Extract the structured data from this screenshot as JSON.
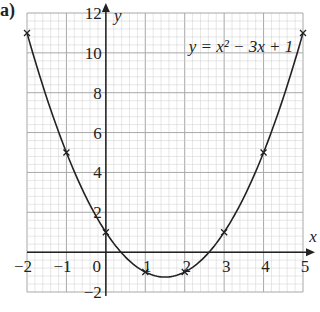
{
  "part_label": "a)",
  "chart_data": {
    "type": "line",
    "title": "",
    "equation_label": "y = x² − 3x + 1",
    "xlabel": "x",
    "ylabel": "y",
    "xlim": [
      -2,
      5
    ],
    "ylim": [
      -2,
      12
    ],
    "x_ticks": [
      -2,
      -1,
      0,
      1,
      2,
      3,
      4,
      5
    ],
    "x_tick_labels": [
      "−2",
      "−1",
      "0",
      "1",
      "2",
      "3",
      "4",
      "5"
    ],
    "y_ticks": [
      -2,
      2,
      4,
      6,
      8,
      10,
      12
    ],
    "y_tick_labels": [
      "−2",
      "2",
      "4",
      "6",
      "8",
      "10",
      "12"
    ],
    "grid": true,
    "series": [
      {
        "name": "y = x² − 3x + 1",
        "x": [
          -2,
          -1,
          0,
          1,
          2,
          3,
          4,
          5
        ],
        "values": [
          11,
          5,
          1,
          -1,
          -1,
          1,
          5,
          11
        ],
        "marker": "x",
        "color": "#222222"
      }
    ]
  },
  "colors": {
    "grid_minor": "#cfcfcf",
    "grid_major": "#a8a8a8",
    "axis": "#222222",
    "curve": "#222222",
    "text": "#222222"
  }
}
